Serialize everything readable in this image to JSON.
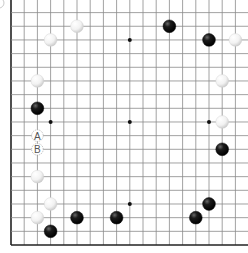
{
  "board": {
    "size": 19,
    "visible_edges": [
      "left",
      "bottom"
    ],
    "colors": {
      "black_stone": "#111111",
      "white_stone": "#f4f4f4",
      "line": "#8a8a8a",
      "edge": "#222222",
      "label_text": "#555555"
    },
    "star_points": [
      {
        "col": 3,
        "row": 3
      },
      {
        "col": 9,
        "row": 3
      },
      {
        "col": 15,
        "row": 3
      },
      {
        "col": 3,
        "row": 9
      },
      {
        "col": 9,
        "row": 9
      },
      {
        "col": 15,
        "row": 9
      },
      {
        "col": 3,
        "row": 15
      },
      {
        "col": 9,
        "row": 15
      },
      {
        "col": 15,
        "row": 15
      }
    ],
    "stones": [
      {
        "color": "white",
        "col": 5,
        "row": 2
      },
      {
        "color": "white",
        "col": 3,
        "row": 3
      },
      {
        "color": "black",
        "col": 12,
        "row": 2
      },
      {
        "color": "black",
        "col": 15,
        "row": 3
      },
      {
        "color": "white",
        "col": 17,
        "row": 3
      },
      {
        "color": "white",
        "col": 2,
        "row": 6
      },
      {
        "color": "white",
        "col": 16,
        "row": 6
      },
      {
        "color": "black",
        "col": 2,
        "row": 8
      },
      {
        "color": "white",
        "col": 16,
        "row": 9
      },
      {
        "color": "black",
        "col": 16,
        "row": 11
      },
      {
        "color": "white",
        "col": 2,
        "row": 13
      },
      {
        "color": "white",
        "col": 3,
        "row": 15
      },
      {
        "color": "black",
        "col": 15,
        "row": 15
      },
      {
        "color": "white",
        "col": 2,
        "row": 16
      },
      {
        "color": "black",
        "col": 5,
        "row": 16
      },
      {
        "color": "black",
        "col": 8,
        "row": 16
      },
      {
        "color": "black",
        "col": 14,
        "row": 16
      },
      {
        "color": "black",
        "col": 3,
        "row": 17
      }
    ],
    "labels": [
      {
        "text": "A",
        "col": 2,
        "row": 10
      },
      {
        "text": "B",
        "col": 2,
        "row": 11
      }
    ]
  }
}
